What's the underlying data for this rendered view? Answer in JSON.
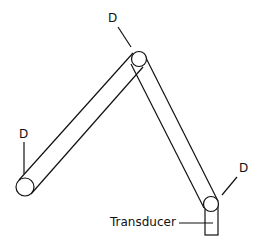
{
  "diagram": {
    "title": "",
    "labels": {
      "top_joint": "D",
      "left_end": "D",
      "right_joint": "D",
      "transducer": "Transducer"
    },
    "colors": {
      "line": "#111111",
      "background": "#ffffff"
    }
  }
}
